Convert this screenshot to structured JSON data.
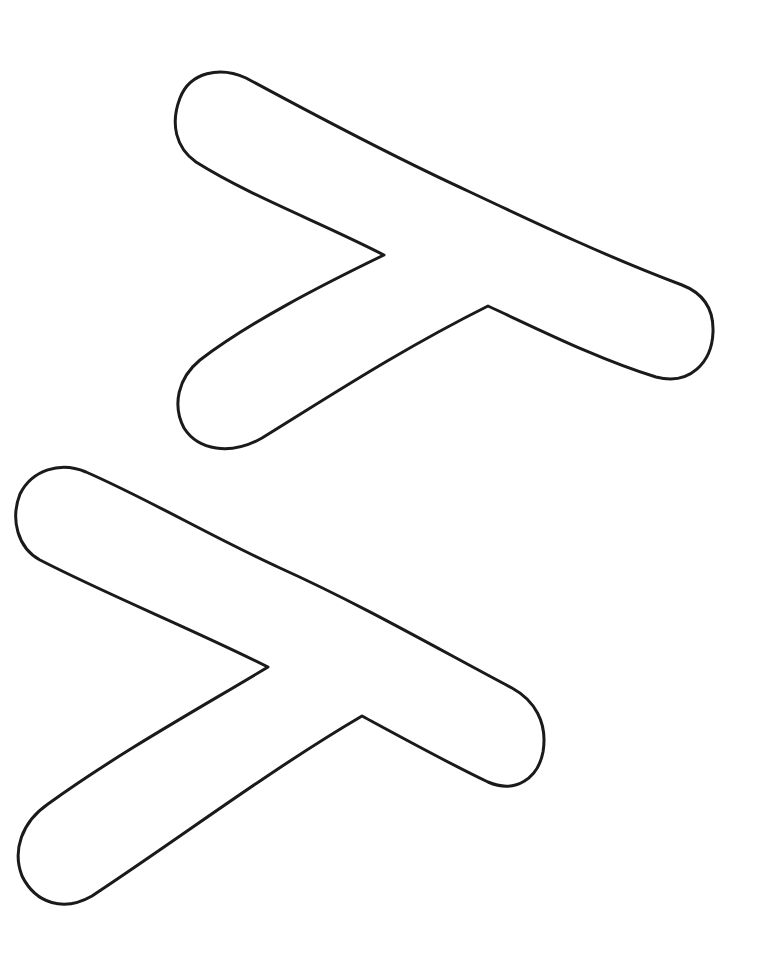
{
  "page": {
    "title": "",
    "background_color": "#ffffff",
    "outline_color": "#1a1a1a"
  },
  "shapes": [
    {
      "name": "upper-y-shape",
      "description": "rounded outlined Y-shaped form"
    },
    {
      "name": "lower-y-shape",
      "description": "rounded outlined Y-shaped form"
    }
  ]
}
